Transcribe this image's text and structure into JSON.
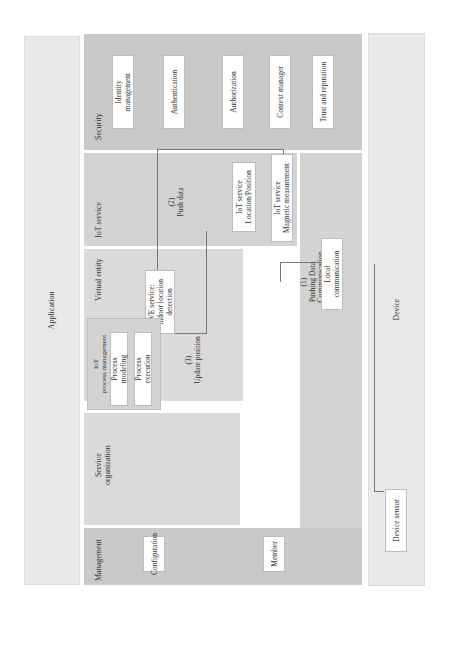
{
  "application": {
    "label": "Application"
  },
  "device": {
    "label": "Device"
  },
  "security": {
    "label": "Security",
    "items": [
      "Identity\nmanagement",
      "Authentication",
      "Authorization",
      "Context manager",
      "Trust and reputation"
    ]
  },
  "iot_service": {
    "label": "IoT service",
    "items": [
      "IoT service\nLocation/Position",
      "IoT service\nMagnetic measurement"
    ]
  },
  "virtual_entity": {
    "label": "Virtual entity",
    "items": [
      "VE service:\nIndoor location\ndetection"
    ]
  },
  "process_mgmt": {
    "label": "IoT\nprocess management",
    "items": [
      "Process\nmodeling",
      "Process\nexecution"
    ]
  },
  "service_org": {
    "label": "Service\norganization"
  },
  "communication": {
    "label": "Communication",
    "items": [
      "Local\ncommunication"
    ]
  },
  "management": {
    "label": "Management",
    "items": [
      "Configuration",
      "Member"
    ]
  },
  "device_sensor": {
    "label": "Device sensor"
  },
  "flows": {
    "push_data": "(2)\nPush data",
    "update_position": "(3)\nUpdate position",
    "pushing_data": "(1)\nPushing Data"
  },
  "colors": {
    "outer": "#e9e9e9",
    "group": "#c9c9c9",
    "panel": "#d3d3d3",
    "box": "#ffffff",
    "line": "#777777"
  }
}
